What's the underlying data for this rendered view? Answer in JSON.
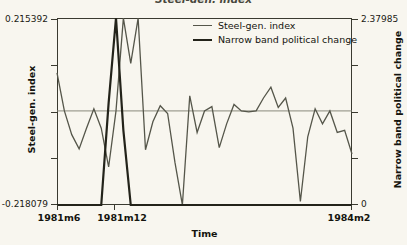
{
  "chart_data": {
    "type": "line",
    "title": "Steel-gen. index",
    "xlabel": "Time",
    "ylabel": "Steel-gen. index",
    "y2label": "Narrow band political change",
    "grid": false,
    "legend_position": "top-center",
    "reference_line_y": 0,
    "x_ticks": [
      "1981m6",
      "1981m12",
      "1984m2"
    ],
    "x_tick_positions": [
      0,
      0.1935,
      1.0
    ],
    "xlim_labels": [
      "1981m6",
      "1984m2"
    ],
    "left_axis": {
      "label": "Steel-gen. index",
      "ticks": [
        "0.215392",
        "",
        "",
        "",
        "-0.218079"
      ],
      "min_label": "-0.218079",
      "max_label": "0.215392",
      "ylim": [
        -0.218079,
        0.215392
      ]
    },
    "right_axis": {
      "label": "Narrow band political change",
      "ticks": [
        "2.37985",
        "",
        "",
        "",
        "0"
      ],
      "min_label": "0",
      "max_label": "2.37985",
      "ylim": [
        0,
        2.37985
      ]
    },
    "series": [
      {
        "name": "Steel-gen. index",
        "axis": "left",
        "color": "#55564a",
        "width": 1.3,
        "x": [
          0.0,
          0.025,
          0.05,
          0.075,
          0.1,
          0.125,
          0.15,
          0.175,
          0.2,
          0.225,
          0.25,
          0.275,
          0.3,
          0.325,
          0.35,
          0.375,
          0.4,
          0.425,
          0.45,
          0.475,
          0.5,
          0.525,
          0.55,
          0.575,
          0.6,
          0.625,
          0.65,
          0.675,
          0.7,
          0.725,
          0.75,
          0.775,
          0.8,
          0.825,
          0.85,
          0.875,
          0.9,
          0.925,
          0.95,
          0.975,
          1.0
        ],
        "values": [
          0.088,
          0.0,
          -0.055,
          -0.088,
          -0.04,
          0.005,
          -0.04,
          -0.13,
          0.0,
          0.215,
          0.11,
          0.215,
          -0.09,
          -0.025,
          0.012,
          -0.006,
          -0.12,
          -0.218,
          0.035,
          -0.05,
          0.0,
          0.01,
          -0.085,
          -0.03,
          0.015,
          0.0,
          -0.002,
          0.0,
          0.03,
          0.055,
          0.008,
          0.03,
          -0.04,
          -0.21,
          -0.06,
          0.005,
          -0.03,
          0.0,
          -0.05,
          -0.045,
          -0.1
        ]
      },
      {
        "name": "Narrow band political change",
        "axis": "right",
        "color": "#23231a",
        "width": 2.2,
        "x": [
          0.0,
          0.025,
          0.05,
          0.075,
          0.1,
          0.125,
          0.15,
          0.175,
          0.2,
          0.225,
          0.25,
          0.275,
          0.3,
          0.325,
          0.35,
          0.375,
          0.4,
          0.425,
          0.45,
          0.475,
          0.5,
          0.525,
          0.55,
          0.575,
          0.6,
          0.625,
          0.65,
          0.675,
          0.7,
          0.725,
          0.75,
          0.775,
          0.8,
          0.825,
          0.85,
          0.875,
          0.9,
          0.925,
          0.95,
          0.975,
          1.0
        ],
        "values": [
          0.0,
          0.0,
          0.0,
          0.0,
          0.0,
          0.0,
          0.0,
          1.3,
          2.38,
          0.95,
          0.0,
          0.0,
          0.0,
          0.0,
          0.0,
          0.0,
          0.0,
          0.0,
          0.0,
          0.0,
          0.0,
          0.0,
          0.0,
          0.0,
          0.0,
          0.0,
          0.0,
          0.0,
          0.0,
          0.0,
          0.0,
          0.0,
          0.0,
          0.0,
          0.0,
          0.0,
          0.0,
          0.0,
          0.0,
          0.0,
          0.0
        ]
      }
    ]
  },
  "legend": {
    "items": [
      {
        "label": "Steel-gen. index",
        "color": "#55564a"
      },
      {
        "label": "Narrow band political change",
        "color": "#23231a"
      }
    ]
  },
  "axes": {
    "left_title": "Steel-gen. index",
    "right_title": "Narrow band political change",
    "x_title": "Time",
    "left_max": "0.215392",
    "left_min": "-0.218079",
    "right_max": "2.37985",
    "right_min": "0",
    "x_tick_1": "1981m6",
    "x_tick_2": "1981m12",
    "x_tick_3": "1984m2"
  },
  "title": {
    "text": "Steel-gen. index"
  }
}
